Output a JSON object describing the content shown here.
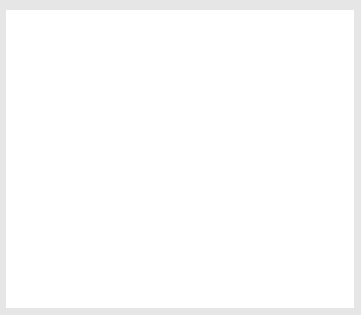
{
  "figure": {
    "axes": {
      "x_label": "x",
      "y_label": "y",
      "origin_label": "O",
      "x_ticks": [
        "2",
        "4",
        "6",
        "8",
        "10",
        "12",
        "14",
        "16"
      ],
      "y_ticks": [
        "2",
        "4",
        "6",
        "8",
        "10",
        "12",
        "14"
      ],
      "x_range": [
        0,
        17
      ],
      "y_range": [
        0,
        15
      ],
      "grid": true
    },
    "shapes": [
      {
        "name": "ABCD",
        "color": "#1a1a1a",
        "vertices": [
          {
            "label": "A",
            "x": 1,
            "y": 8
          },
          {
            "label": "B",
            "x": 9,
            "y": 14
          },
          {
            "label": "C",
            "x": 15,
            "y": 6
          },
          {
            "label": "D",
            "x": 7,
            "y": 0
          }
        ]
      },
      {
        "name": "A'B'C'D'",
        "color": "#9a9a9a",
        "vertices": [
          {
            "label": "A'",
            "x": 5,
            "y": 8
          },
          {
            "label": "B'",
            "x": 9,
            "y": 11
          },
          {
            "label": "C'",
            "x": 12,
            "y": 7
          },
          {
            "label": "D'",
            "x": 8,
            "y": 4
          }
        ]
      }
    ]
  }
}
